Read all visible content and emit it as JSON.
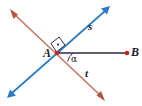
{
  "figure": {
    "background_color": "#ffffff",
    "width": 142,
    "height": 106
  },
  "colors": {
    "line_s": "#2b7cc4",
    "line_t": "#c9725e",
    "ray_AB": "#2b2b45",
    "point": "#cc2222",
    "label": "#1a1a2e",
    "angle_arc": "#2b2b45",
    "right_angle_mark": "#2b2b45"
  },
  "labels": {
    "point_A": "A",
    "point_B": "B",
    "line_s": "s",
    "line_t": "t",
    "angle_alpha": "α"
  },
  "geometry": {
    "intersection": {
      "name": "A",
      "x": 57,
      "y": 53
    },
    "endpoint_B": {
      "name": "B",
      "x": 127,
      "y": 53
    },
    "line_s": {
      "name": "s",
      "color": "#2b7cc4",
      "arrows": "both",
      "from": {
        "x": 9,
        "y": 96
      },
      "to": {
        "x": 108,
        "y": 8
      }
    },
    "line_t": {
      "name": "t",
      "color": "#c9725e",
      "arrows": "both",
      "from": {
        "x": 12,
        "y": 12
      },
      "to": {
        "x": 103,
        "y": 98
      }
    },
    "ray_AB": {
      "name": "AB",
      "color": "#2b2b45",
      "arrows": "none",
      "from": {
        "x": 57,
        "y": 53
      },
      "to": {
        "x": 127,
        "y": 53
      }
    },
    "right_angle": {
      "at": "A",
      "between": [
        "s",
        "t"
      ],
      "measure_degrees": 90,
      "marker": "square-with-dot"
    },
    "angle_alpha": {
      "at": "A",
      "between": [
        "AB",
        "t"
      ],
      "label": "α"
    }
  }
}
